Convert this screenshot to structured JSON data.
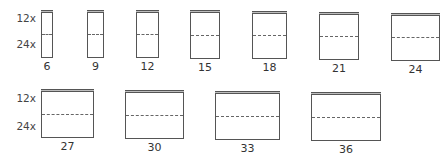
{
  "row_labels": {
    "top": "12x",
    "bottom": "24x"
  },
  "sizes": [
    {
      "label": "6",
      "x": 41,
      "y": 10,
      "w": 12,
      "h": 48
    },
    {
      "label": "9",
      "x": 87,
      "y": 10,
      "w": 17,
      "h": 48
    },
    {
      "label": "12",
      "x": 136,
      "y": 10,
      "w": 23,
      "h": 48
    },
    {
      "label": "15",
      "x": 190,
      "y": 10,
      "w": 30,
      "h": 49
    },
    {
      "label": "18",
      "x": 252,
      "y": 11,
      "w": 35,
      "h": 48
    },
    {
      "label": "21",
      "x": 319,
      "y": 12,
      "w": 40,
      "h": 48
    },
    {
      "label": "24",
      "x": 391,
      "y": 13,
      "w": 49,
      "h": 48
    },
    {
      "label": "27",
      "x": 41,
      "y": 89,
      "w": 53,
      "h": 49
    },
    {
      "label": "30",
      "x": 125,
      "y": 90,
      "w": 59,
      "h": 49
    },
    {
      "label": "33",
      "x": 215,
      "y": 91,
      "w": 65,
      "h": 49
    },
    {
      "label": "36",
      "x": 311,
      "y": 92,
      "w": 70,
      "h": 49
    }
  ]
}
